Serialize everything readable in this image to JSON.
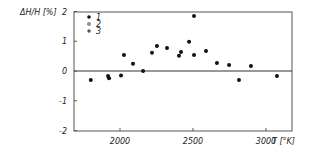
{
  "chart_data": {
    "type": "scatter",
    "title": "",
    "xlabel": "T [°K]",
    "ylabel": "ΔH/H [%]",
    "xlim": [
      1700,
      3180
    ],
    "ylim": [
      -2,
      2
    ],
    "x_ticks": [
      2000,
      2500,
      3000
    ],
    "x_tick_labels": [
      "2000",
      "2500",
      "3000"
    ],
    "y_ticks": [
      2,
      1,
      0,
      -1,
      -2
    ],
    "y_tick_labels": [
      "2",
      "1",
      "0",
      "-1",
      "-2"
    ],
    "grid": false,
    "reference_line": {
      "y": 0
    },
    "legend": {
      "position": "upper left",
      "entries": [
        {
          "label": "1",
          "marker": "filled-circle"
        },
        {
          "label": "2",
          "marker": "open-circle"
        },
        {
          "label": "3",
          "marker": "half-filled-circle"
        }
      ]
    },
    "series": [
      {
        "name": "1",
        "points": [
          {
            "x": 1800,
            "y": -0.3
          },
          {
            "x": 1918,
            "y": -0.17
          },
          {
            "x": 1925,
            "y": -0.24
          },
          {
            "x": 2007,
            "y": -0.15
          },
          {
            "x": 2027,
            "y": 0.54
          },
          {
            "x": 2089,
            "y": 0.24
          },
          {
            "x": 2158,
            "y": 0.0
          },
          {
            "x": 2219,
            "y": 0.61
          },
          {
            "x": 2253,
            "y": 0.84
          },
          {
            "x": 2322,
            "y": 0.77
          },
          {
            "x": 2404,
            "y": 0.51
          },
          {
            "x": 2418,
            "y": 0.64
          },
          {
            "x": 2473,
            "y": 0.98
          },
          {
            "x": 2507,
            "y": 1.85
          },
          {
            "x": 2507,
            "y": 0.54
          },
          {
            "x": 2589,
            "y": 0.67
          },
          {
            "x": 2664,
            "y": 0.27
          },
          {
            "x": 2747,
            "y": 0.2
          },
          {
            "x": 2815,
            "y": -0.3
          },
          {
            "x": 2897,
            "y": 0.17
          },
          {
            "x": 3075,
            "y": -0.17
          }
        ]
      }
    ]
  },
  "colors": {
    "frame": "#555555",
    "marker": "#111111",
    "text": "#222222"
  }
}
